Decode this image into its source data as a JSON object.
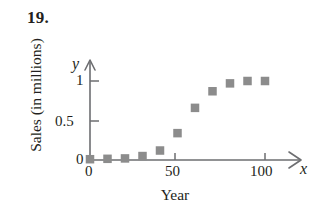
{
  "problem": {
    "number": "19."
  },
  "axes": {
    "y_variable": "y",
    "x_variable": "x",
    "y_title": "Sales (in millions)",
    "x_title": "Year",
    "y_ticks": [
      {
        "label": "0",
        "value": 0
      },
      {
        "label": "0.5",
        "value": 0.5
      },
      {
        "label": "1",
        "value": 1
      }
    ],
    "x_ticks": [
      {
        "label": "0",
        "value": 0
      },
      {
        "label": "50",
        "value": 50
      },
      {
        "label": "100",
        "value": 100
      }
    ]
  },
  "colors": {
    "marker": "#8c8c8c",
    "axis": "#6d6e71",
    "text": "#231f20",
    "background": "#ffffff"
  },
  "chart_data": {
    "type": "scatter",
    "title": "",
    "xlabel": "Year",
    "ylabel": "Sales (in millions)",
    "xlim": [
      0,
      105
    ],
    "ylim": [
      0,
      1.12
    ],
    "grid": false,
    "legend": null,
    "x": [
      0,
      10,
      20,
      30,
      40,
      50,
      60,
      70,
      80,
      90,
      100
    ],
    "y": [
      0.01,
      0.015,
      0.02,
      0.05,
      0.12,
      0.34,
      0.66,
      0.87,
      0.97,
      1.0,
      1.0
    ],
    "series": [
      {
        "name": "Sales",
        "marker": "square",
        "color": "#8c8c8c",
        "values": [
          0.01,
          0.015,
          0.02,
          0.05,
          0.12,
          0.34,
          0.66,
          0.87,
          0.97,
          1.0,
          1.0
        ]
      }
    ],
    "xticks": [
      0,
      50,
      100
    ],
    "xticklabels": [
      "0",
      "50",
      "100"
    ],
    "yticks": [
      0,
      0.5,
      1
    ],
    "yticklabels": [
      "0",
      "0.5",
      "1"
    ]
  }
}
